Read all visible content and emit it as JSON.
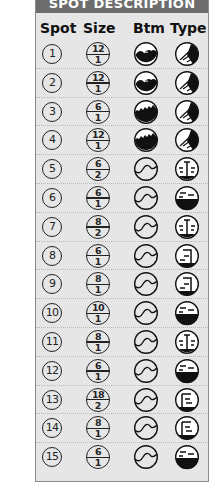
{
  "title": "SPOT DESCRIPTION",
  "columns": {
    "spot": "Spot",
    "size": "Size",
    "btm": "Btm",
    "type": "Type"
  },
  "rows": [
    {
      "spot": "1",
      "size_top": "12",
      "size_bottom": "1",
      "btm": "rock-hump",
      "type": "diagonal-ledge"
    },
    {
      "spot": "2",
      "size_top": "12",
      "size_bottom": "1",
      "btm": "rock-hump",
      "type": "diagonal-ledge"
    },
    {
      "spot": "3",
      "size_top": "6",
      "size_bottom": "1",
      "btm": "rock-jagged",
      "type": "diagonal-ledge"
    },
    {
      "spot": "4",
      "size_top": "12",
      "size_bottom": "1",
      "btm": "rock-jagged",
      "type": "diagonal-ledge"
    },
    {
      "spot": "5",
      "size_top": "6",
      "size_bottom": "2",
      "btm": "sand-wave",
      "type": "center-pillar"
    },
    {
      "spot": "6",
      "size_top": "6",
      "size_bottom": "1",
      "btm": "sand-wave",
      "type": "half-filled"
    },
    {
      "spot": "7",
      "size_top": "8",
      "size_bottom": "2",
      "btm": "sand-wave",
      "type": "center-pillar"
    },
    {
      "spot": "8",
      "size_top": "6",
      "size_bottom": "1",
      "btm": "sand-wave",
      "type": "right-wall"
    },
    {
      "spot": "9",
      "size_top": "8",
      "size_bottom": "1",
      "btm": "sand-wave",
      "type": "right-wall"
    },
    {
      "spot": "10",
      "size_top": "10",
      "size_bottom": "1",
      "btm": "sand-wave",
      "type": "half-filled"
    },
    {
      "spot": "11",
      "size_top": "8",
      "size_bottom": "1",
      "btm": "sand-wave",
      "type": "center-pillar"
    },
    {
      "spot": "12",
      "size_top": "6",
      "size_bottom": "1",
      "btm": "sand-wave",
      "type": "half-filled"
    },
    {
      "spot": "13",
      "size_top": "18",
      "size_bottom": "2",
      "btm": "sand-wave",
      "type": "left-wall"
    },
    {
      "spot": "14",
      "size_top": "8",
      "size_bottom": "1",
      "btm": "sand-wave",
      "type": "left-wall"
    },
    {
      "spot": "15",
      "size_top": "6",
      "size_bottom": "1",
      "btm": "sand-wave",
      "type": "half-filled"
    }
  ],
  "colors": {
    "banner": "#6d6d6d",
    "panel": "#e6e6e6",
    "ink": "#111111"
  }
}
